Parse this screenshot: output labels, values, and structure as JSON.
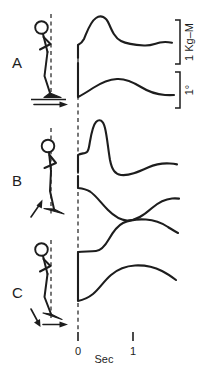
{
  "figure": {
    "title": "",
    "panels": [
      {
        "label": "A",
        "posture_description": "forward-leaning stick figure with bent arm, foot on platform",
        "perturbation_arrows": [
          "horizontal-right"
        ],
        "traces": [
          {
            "name": "torque-trace-a",
            "units": "1 Kg-M",
            "shape": "step up at 0, sharp rise to early peak, decay with shallow trough then small recovery"
          },
          {
            "name": "angle-trace-a",
            "units": "1 deg",
            "shape": "slow rise to broad low hump then gradual decay to flat"
          }
        ]
      },
      {
        "label": "B",
        "posture_description": "upright stick figure with bent arm, foot tilted",
        "perturbation_arrows": [
          "rotation-up-left"
        ],
        "traces": [
          {
            "name": "torque-trace-b",
            "units": "1 Kg-M",
            "shape": "small step then tall narrow spike, fall below baseline, slow recovery to plateau"
          },
          {
            "name": "angle-trace-b",
            "units": "1 deg",
            "shape": "step then fall to deep trough, slow rise back to plateau"
          }
        ]
      },
      {
        "label": "C",
        "posture_description": "forward-leaning stick figure with bent arm, foot on tilted platform",
        "perturbation_arrows": [
          "diagonal-down-left",
          "horizontal-right"
        ],
        "traces": [
          {
            "name": "torque-trace-c",
            "units": "1 Kg-M",
            "shape": "flat plateau then sigmoid rise to broad rounded peak with slight decay"
          },
          {
            "name": "angle-trace-c",
            "units": "1 deg",
            "shape": "starts low, sigmoid rise to broad rounded plateau with slight decay"
          }
        ]
      }
    ],
    "x_axis": {
      "label": "Sec",
      "ticks": [
        {
          "value": "0",
          "position": "origin"
        },
        {
          "value": "1",
          "position": "one-second"
        }
      ]
    },
    "scale_bars": [
      {
        "name": "torque-scale",
        "label": "1 Kg–M",
        "orientation": "vertical-rotated"
      },
      {
        "name": "angle-scale",
        "label": "1°",
        "orientation": "vertical-rotated"
      }
    ]
  }
}
